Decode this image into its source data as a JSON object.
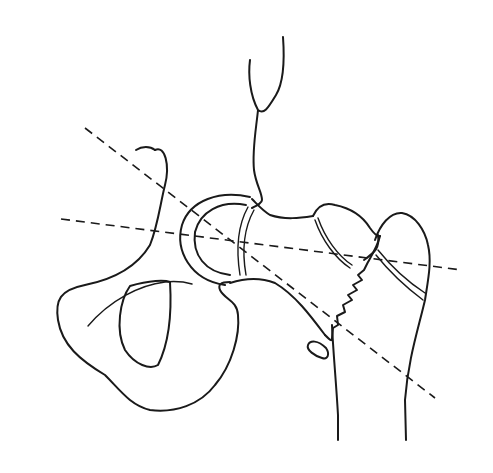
{
  "figure": {
    "background": "#ffffff",
    "ink": "#1a1a1a",
    "width": 493,
    "height": 473
  },
  "shapes": {
    "pelvis_outline": "M155,150 C165,145 170,165 165,185 C160,205 158,225 150,245 C135,270 110,280 85,285 C60,290 55,300 58,320 C62,345 80,360 105,375 C120,390 130,405 150,410 C175,413 200,405 215,385 C232,365 240,335 238,315 C237,300 225,300 220,290 C218,285 220,282 230,282",
    "pelvis_crest": "M136,150 C142,146 150,146 155,150",
    "obturator": "M130,286 C120,300 115,330 125,350 C135,365 150,370 158,365 C168,345 172,315 170,282 C165,280 150,280 130,286 Z",
    "pubic_line": "M88,326 C110,300 140,285 165,282 C175,281 185,282 192,284",
    "acetabulum_outer": "M250,197 C220,190 190,200 182,225 C175,250 190,280 225,285",
    "acetabulum_inner": "M246,205 C220,200 200,212 195,232 C192,255 205,272 230,275",
    "femoral_head_line1": "M248,207 C238,225 236,250 240,275",
    "femoral_head_line2": "M254,210 C244,228 242,252 246,275",
    "neck_upper": "M252,199 C258,205 262,210 270,215 C285,220 300,218 313,216",
    "neck_lower": "M230,283 C245,278 260,277 275,283 C295,295 310,315 325,335",
    "capsule": "M250,60 C248,75 250,95 258,110 C264,115 268,108 276,95 C282,85 285,65 283,37 M258,110 C256,130 252,150 254,170 C256,185 262,192 262,200 C262,203 258,205 252,208",
    "greater_troch": "M313,216 C318,205 325,202 335,205 C350,208 362,215 370,228 C375,235 378,237 380,236",
    "fracture_edge": "M380,236 C378,245 372,255 368,262 L364,270 L358,275 L362,280 L353,285 L357,290 L348,295 L352,300 L343,305 L345,312 L337,316 L338,325 L333,328 L332,338 M325,335 C330,340 332,342 332,338",
    "troch_inner_lines": "M315,220 C322,240 335,258 350,268 M318,218 C325,238 338,256 352,265",
    "shaft_left": "M332,325 C333,350 336,380 338,415 L338,440",
    "shaft_right_head": "M375,240 C380,225 390,212 402,213 C415,215 425,230 428,245 C432,262 428,280 425,300 C418,330 408,360 405,400 L406,440",
    "troch_frag": "M364,260 C375,252 380,248 378,235",
    "distal_lines": "M378,250 C390,265 405,280 425,293 M376,255 C388,270 403,285 423,300",
    "lesser_troch": "M308,345 C310,340 318,340 326,348 C330,354 328,360 322,358 C315,356 306,350 308,345 Z",
    "axis_neck": {
      "x1": 85,
      "y1": 128,
      "x2": 435,
      "y2": 398
    },
    "axis_horizontal": {
      "x1": 61,
      "y1": 219,
      "x2": 462,
      "y2": 270
    }
  }
}
